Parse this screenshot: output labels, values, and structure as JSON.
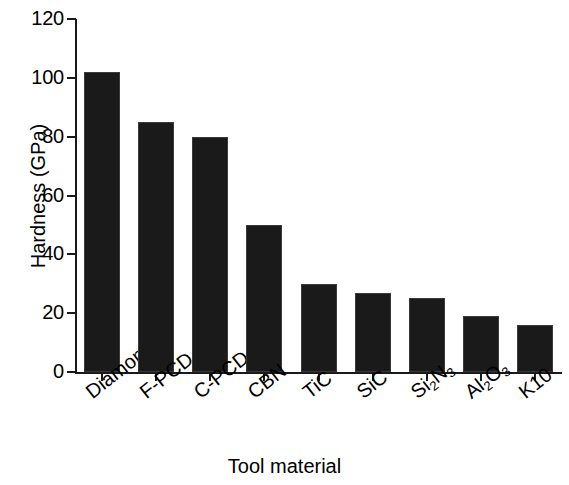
{
  "chart_data": {
    "type": "bar",
    "title": "",
    "xlabel": "Tool material",
    "ylabel": "Hardness (GPa)",
    "categories": [
      "Diamond",
      "F-PCD",
      "C-PCD",
      "CBN",
      "TiC",
      "SiC",
      "Si2N3",
      "Al2O3",
      "K10"
    ],
    "category_labels_html": [
      "Diamond",
      "F-PCD",
      "C-PCD",
      "CBN",
      "TiC",
      "SiC",
      "Si<sub>2</sub>N<sub>3</sub>",
      "Al<sub>2</sub>O<sub>3</sub>",
      "K10"
    ],
    "values": [
      102,
      85,
      80,
      50,
      30,
      27,
      25,
      19,
      16
    ],
    "ylim": [
      0,
      120
    ],
    "ytick_values": [
      0,
      20,
      40,
      60,
      80,
      100,
      120
    ],
    "ytick_labels": [
      "0",
      "20",
      "40",
      "60",
      "80",
      "100",
      "120"
    ],
    "grid": false,
    "legend": null,
    "bar_color": "#1a1a1a",
    "axis_color": "#1a1a1a",
    "background_color": "#ffffff"
  }
}
